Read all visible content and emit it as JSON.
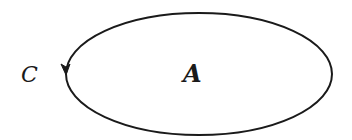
{
  "diagram": {
    "curve_label": "C",
    "region_label": "A",
    "curve": {
      "shape": "ellipse",
      "cx": 199,
      "cy": 74,
      "rx": 133,
      "ry": 61,
      "orientation": "counterclockwise",
      "stroke": "#1a1a1a"
    }
  }
}
